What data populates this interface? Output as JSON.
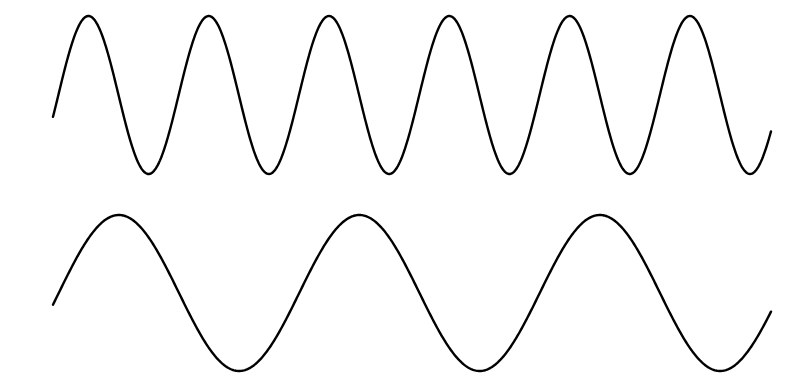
{
  "canvas": {
    "width": 803,
    "height": 374,
    "background": "#ffffff"
  },
  "stroke_color": "#000000",
  "waves": [
    {
      "name": "high-frequency-sine-wave",
      "x_start": 53,
      "x_end": 771,
      "center_y": 95,
      "amplitude": 79,
      "period_px": 120.3,
      "phase_at_start_rad": -0.28,
      "cycles": 6
    },
    {
      "name": "low-frequency-sine-wave",
      "x_start": 53,
      "x_end": 771,
      "center_y": 293,
      "amplitude": 78,
      "period_px": 240.5,
      "phase_at_start_rad": -0.15,
      "cycles": 3
    }
  ]
}
